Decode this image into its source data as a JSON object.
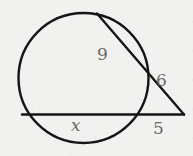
{
  "figure": {
    "background_color": "#f1f1ef",
    "stroke_color": "#151515",
    "label_color": "#6b6b6b"
  },
  "circle": {
    "name": "circle-outline",
    "cx": 83.5,
    "cy": 78,
    "r": 65,
    "stroke_width": 2.4
  },
  "secants": [
    {
      "id": "upper-secant",
      "name": "upper-secant-line",
      "from_x": 97,
      "from_y": 13.5,
      "to_x": 184,
      "to_y": 114.5,
      "chord_label": "9",
      "external_label": "6"
    },
    {
      "id": "lower-secant",
      "name": "lower-secant-line",
      "from_x": 22,
      "from_y": 114.5,
      "to_x": 184,
      "to_y": 114.5,
      "chord_label": "x",
      "external_label": "5"
    }
  ],
  "labels": [
    {
      "id": "label-9",
      "name": "segment-label-9",
      "text": "9",
      "x": 97,
      "y": 46,
      "italic": false
    },
    {
      "id": "label-6",
      "name": "segment-label-6",
      "text": "6",
      "x": 156,
      "y": 72,
      "italic": false
    },
    {
      "id": "label-x",
      "name": "segment-label-x",
      "text": "x",
      "x": 71,
      "y": 117,
      "italic": true
    },
    {
      "id": "label-5",
      "name": "segment-label-5",
      "text": "5",
      "x": 153,
      "y": 120,
      "italic": false
    }
  ],
  "vertex": {
    "name": "external-vertex",
    "x": 184,
    "y": 114.5
  }
}
